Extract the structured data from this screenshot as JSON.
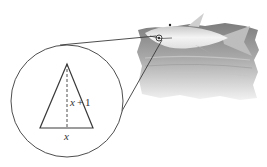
{
  "figure": {
    "labels": {
      "height": "x + 1",
      "height_var": "x",
      "height_op": "+",
      "height_num": "1",
      "base": "x"
    }
  },
  "colors": {
    "line": "#3a3a3a",
    "water_dark": "#8a8a8a",
    "water_light": "#d8d8d8",
    "shark_body": "#eeeeee",
    "shark_shade": "#b5b5b5"
  }
}
